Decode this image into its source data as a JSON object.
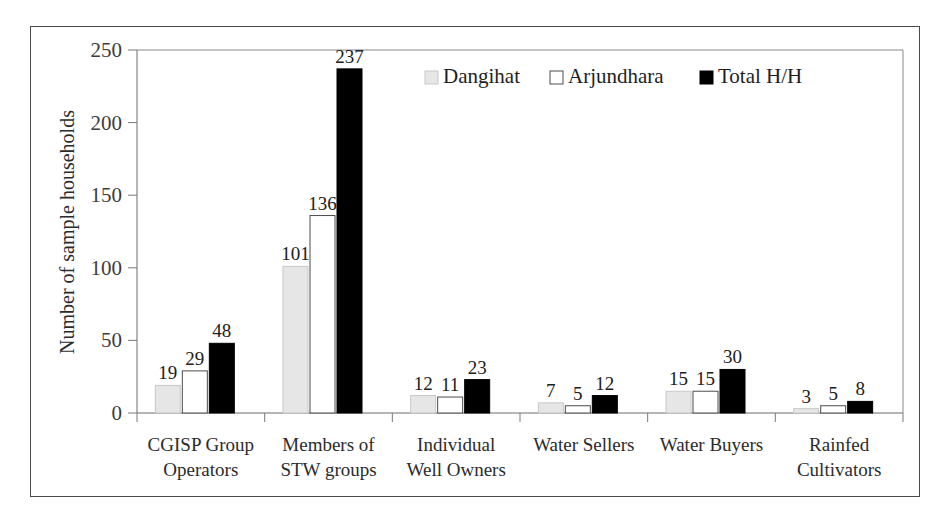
{
  "chart_data": {
    "type": "bar",
    "title": "",
    "xlabel": "",
    "ylabel": "Number of sample households",
    "ylim": [
      0,
      250
    ],
    "yticks": [
      0,
      50,
      100,
      150,
      200,
      250
    ],
    "grid": false,
    "legend_position": "top-right-inside",
    "categories": [
      "CGISP Group Operators",
      "Members of STW groups",
      "Individual Well Owners",
      "Water Sellers",
      "Water Buyers",
      "Rainfed Cultivators"
    ],
    "category_lines": [
      [
        "CGISP Group",
        "Operators"
      ],
      [
        "Members of",
        "STW groups"
      ],
      [
        "Individual",
        "Well Owners"
      ],
      [
        "Water Sellers",
        ""
      ],
      [
        "Water Buyers",
        ""
      ],
      [
        "Rainfed",
        "Cultivators"
      ]
    ],
    "series": [
      {
        "name": "Dangihat",
        "values": [
          19,
          101,
          12,
          7,
          15,
          3
        ],
        "fill": "#e6e6e6",
        "stroke": "#c8c8c8"
      },
      {
        "name": "Arjundhara",
        "values": [
          29,
          136,
          11,
          5,
          15,
          5
        ],
        "fill": "#ffffff",
        "stroke": "#4d4d4d"
      },
      {
        "name": "Total H/H",
        "values": [
          48,
          237,
          23,
          12,
          30,
          8
        ],
        "fill": "#000000",
        "stroke": "#000000"
      }
    ]
  },
  "legend": {
    "items": [
      {
        "label": "Dangihat"
      },
      {
        "label": "Arjundhara"
      },
      {
        "label": "Total H/H"
      }
    ]
  },
  "axes": {
    "y_title": "Number of sample households",
    "y_tick_labels": [
      "0",
      "50",
      "100",
      "150",
      "200",
      "250"
    ]
  }
}
